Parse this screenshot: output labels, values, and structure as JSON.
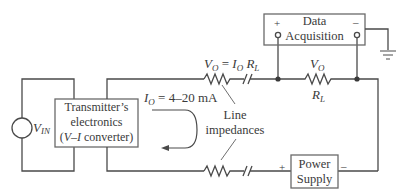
{
  "diagram": {
    "type": "circuit",
    "colors": {
      "line": "#4a4a4a",
      "box_border": "#6a6a6a",
      "text": "#3a3a3a",
      "background": "#ffffff"
    },
    "components": {
      "data_acquisition": {
        "line1": "Data",
        "line2": "Acquisition",
        "plus": "+",
        "minus": "–"
      },
      "transmitter": {
        "line1": "Transmitter’s",
        "line2": "electronics",
        "line3_open": "(",
        "line3_italic": "V–I",
        "line3_rest": " converter)"
      },
      "power_supply": {
        "line1": "Power",
        "line2": "Supply",
        "plus": "+",
        "minus": "–"
      },
      "vin": {
        "symbol": "V",
        "subscript": "IN"
      }
    },
    "labels": {
      "vo_eq": {
        "v": "V",
        "v_sub": "O",
        "eq": " = ",
        "i": "I",
        "i_sub": "O",
        "r": " R",
        "r_sub": "L"
      },
      "vo": {
        "v": "V",
        "v_sub": "O"
      },
      "rl": {
        "r": "R",
        "r_sub": "L"
      },
      "io": {
        "i": "I",
        "i_sub": "O",
        "rest": " = 4–20 mA"
      },
      "line_impedances": {
        "line1": "Line",
        "line2": "impedances"
      }
    }
  }
}
